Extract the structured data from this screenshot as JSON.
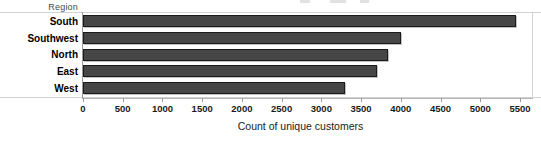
{
  "chart_data": {
    "type": "bar",
    "orientation": "horizontal",
    "title": "",
    "xlabel": "Count of unique customers",
    "ylabel": "Region",
    "categories": [
      "South",
      "Southwest",
      "North",
      "East",
      "West"
    ],
    "values": [
      5450,
      4000,
      3840,
      3700,
      3300
    ],
    "series": [
      {
        "name": "Count of unique customers",
        "values": [
          5450,
          4000,
          3840,
          3700,
          3300
        ]
      }
    ],
    "xlim": [
      0,
      5500
    ],
    "ylim": null,
    "xticks": [
      0,
      500,
      1000,
      1500,
      2000,
      2500,
      3000,
      3500,
      4000,
      4500,
      5000,
      5500
    ],
    "xtick_labels": [
      "0",
      "500",
      "1000",
      "1500",
      "2000",
      "2500",
      "3000",
      "3500",
      "4000",
      "4500",
      "5000",
      "5500"
    ],
    "grid": false,
    "legend": null,
    "legend_position": "none",
    "bar_color": "#464646",
    "bar_border_color": "#1b1b1b",
    "background_color": "#ffffff",
    "axis_color": "#9a9a9a"
  },
  "field_header": {
    "label": "Region"
  },
  "axis": {
    "x_title": "Count of unique customers"
  }
}
